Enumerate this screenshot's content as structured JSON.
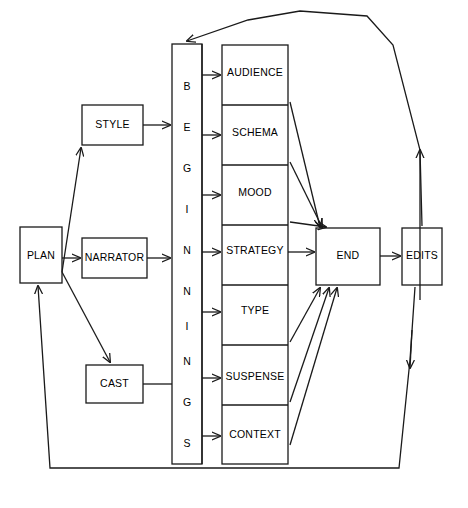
{
  "diagram": {
    "ink_color": "#1a1a1a",
    "background": "#ffffff",
    "left_nodes": [
      {
        "id": "plan",
        "label": "PLAN"
      },
      {
        "id": "style",
        "label": "STYLE"
      },
      {
        "id": "narrator",
        "label": "NARRATOR"
      },
      {
        "id": "cast",
        "label": "CAST"
      }
    ],
    "beginnings_column": {
      "id": "beginnings",
      "label": "BEGINNINGS",
      "letters": [
        "B",
        "E",
        "G",
        "I",
        "N",
        "N",
        "I",
        "N",
        "G",
        "S"
      ]
    },
    "stack_cells": [
      {
        "id": "audience",
        "label": "AUDIENCE"
      },
      {
        "id": "schema",
        "label": "SCHEMA"
      },
      {
        "id": "mood",
        "label": "MOOD"
      },
      {
        "id": "strategy",
        "label": "STRATEGY"
      },
      {
        "id": "type",
        "label": "TYPE"
      },
      {
        "id": "suspense",
        "label": "SUSPENSE"
      },
      {
        "id": "context",
        "label": "CONTEXT"
      }
    ],
    "right_nodes": [
      {
        "id": "end",
        "label": "END"
      },
      {
        "id": "edits",
        "label": "EDITS"
      }
    ]
  }
}
